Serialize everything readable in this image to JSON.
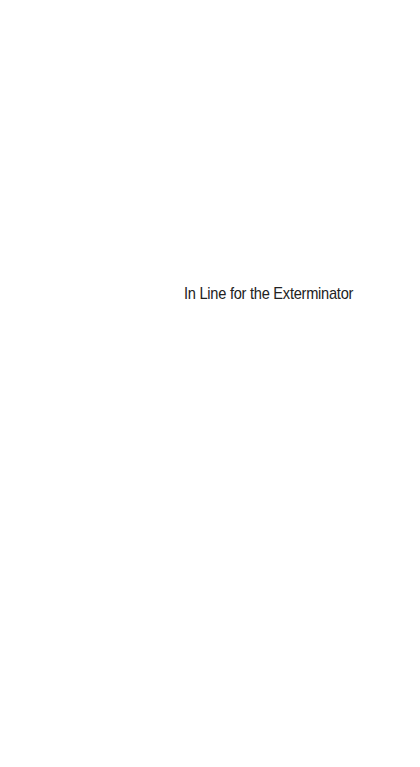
{
  "page": {
    "type": "half-title",
    "background_color": "#ffffff",
    "text_color": "#222222",
    "title": "In Line for the Exterminator"
  }
}
